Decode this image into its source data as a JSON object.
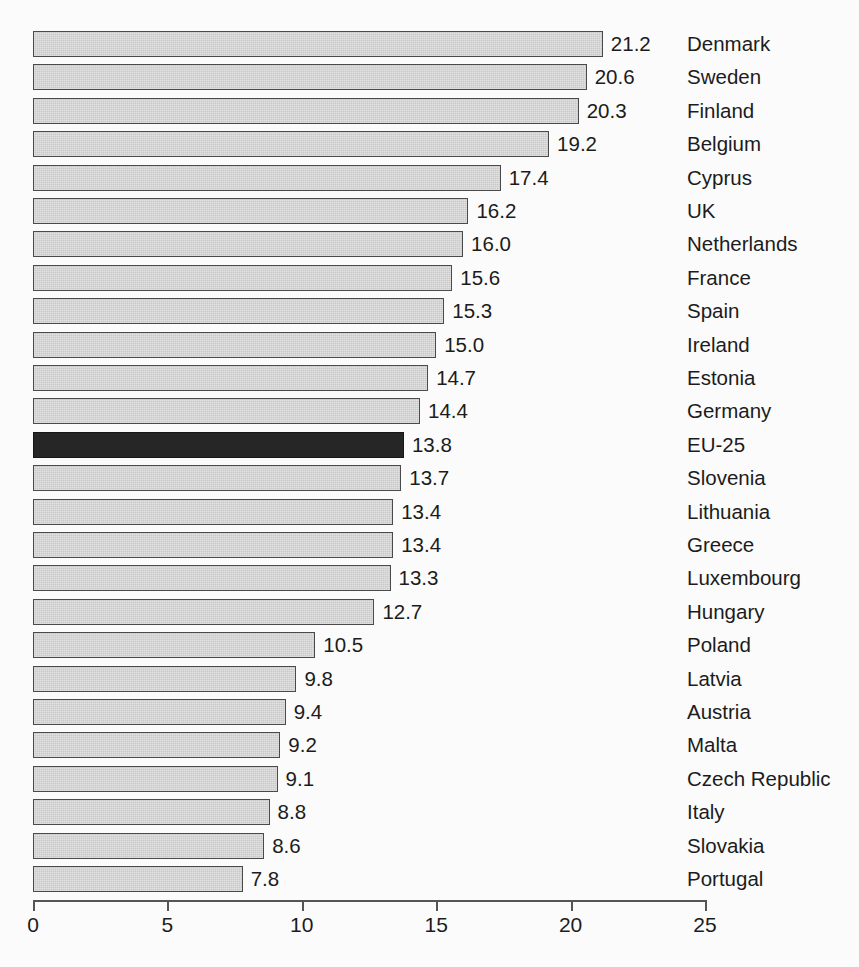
{
  "chart_data": {
    "type": "bar",
    "orientation": "horizontal",
    "title": "",
    "subtitle": "",
    "xlabel": "",
    "ylabel": "",
    "xlim": [
      0,
      25
    ],
    "ticks": [
      0,
      5,
      10,
      15,
      20,
      25
    ],
    "tick_labels": [
      "0",
      "5",
      "10",
      "15",
      "20",
      "25"
    ],
    "grid": false,
    "legend": "none",
    "highlight_category": "EU-25",
    "colors": {
      "bar_fill": "#c9c9c9",
      "bar_border": "#4a4a4a",
      "highlight_fill": "#262626",
      "highlight_border": "#161616",
      "axis": "#555555",
      "text": "#1c1c1c",
      "background": "#fbfbfb"
    },
    "categories": [
      "Denmark",
      "Sweden",
      "Finland",
      "Belgium",
      "Cyprus",
      "UK",
      "Netherlands",
      "France",
      "Spain",
      "Ireland",
      "Estonia",
      "Germany",
      "EU-25",
      "Slovenia",
      "Lithuania",
      "Greece",
      "Luxembourg",
      "Hungary",
      "Poland",
      "Latvia",
      "Austria",
      "Malta",
      "Czech Republic",
      "Italy",
      "Slovakia",
      "Portugal"
    ],
    "values": [
      21.2,
      20.6,
      20.3,
      19.2,
      17.4,
      16.2,
      16.0,
      15.6,
      15.3,
      15.0,
      14.7,
      14.4,
      13.8,
      13.7,
      13.4,
      13.4,
      13.3,
      12.7,
      10.5,
      9.8,
      9.4,
      9.2,
      9.1,
      8.8,
      8.6,
      7.8
    ],
    "value_labels": [
      "21.2",
      "20.6",
      "20.3",
      "19.2",
      "17.4",
      "16.2",
      "16.0",
      "15.6",
      "15.3",
      "15.0",
      "14.7",
      "14.4",
      "13.8",
      "13.7",
      "13.4",
      "13.4",
      "13.3",
      "12.7",
      "10.5",
      "9.8",
      "9.4",
      "9.2",
      "9.1",
      "8.8",
      "8.6",
      "7.8"
    ]
  }
}
